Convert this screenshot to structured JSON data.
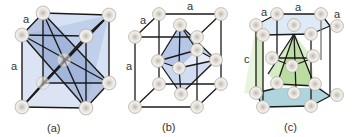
{
  "figure": {
    "panels": [
      {
        "id": "a",
        "caption": "(a)",
        "edge_labels": [
          "a",
          "a"
        ]
      },
      {
        "id": "b",
        "caption": "(b)",
        "edge_labels": [
          "a",
          "a",
          "a"
        ]
      },
      {
        "id": "c",
        "caption": "(c)",
        "edge_labels": [
          "a",
          "a",
          "a",
          "c"
        ]
      }
    ]
  },
  "colors": {
    "atom_fill": "#e4e0da",
    "atom_stroke": "#b8b2aa",
    "edge": "#1a1a1a",
    "face_blue": "#7f97c9",
    "face_light_blue": "#c9d8ee",
    "face_green": "#9fcf7a",
    "face_light_green": "#d8eec6",
    "face_teal": "#6fb3bf"
  }
}
